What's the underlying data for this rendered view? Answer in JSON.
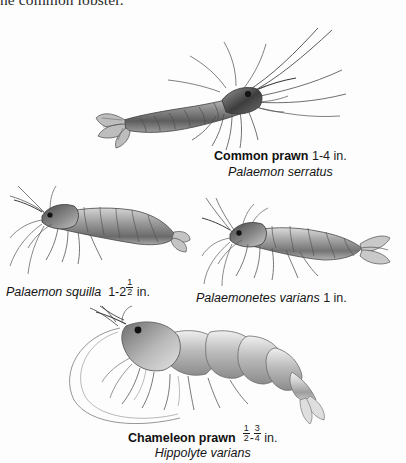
{
  "page": {
    "width": 406,
    "height": 463,
    "background": "#fdfdfd",
    "ink": "#1a1a1a",
    "running_text_clipped": "ne common lobster."
  },
  "figures": [
    {
      "id": "common-prawn",
      "common_name": "Common prawn",
      "size": "1-4 in.",
      "scientific_name": "Palaemon serratus",
      "orientation": "head-right",
      "caption_style": "bold-common-name"
    },
    {
      "id": "palaemon-squilla",
      "common_name": "",
      "size_prefix": "1-2",
      "size_fraction_num": "1",
      "size_fraction_den": "2",
      "size_suffix": "in.",
      "size_plain": "1-2 1/2 in.",
      "scientific_name": "Palaemon squilla",
      "orientation": "head-left",
      "caption_style": "italic-scientific-first"
    },
    {
      "id": "palaemonetes-varians",
      "common_name": "",
      "size": "1 in.",
      "scientific_name": "Palaemonetes varians",
      "orientation": "head-left",
      "caption_style": "italic-scientific-first"
    },
    {
      "id": "chameleon-prawn",
      "common_name": "Chameleon prawn",
      "size_fraction_a_num": "1",
      "size_fraction_a_den": "2",
      "size_fraction_b_num": "3",
      "size_fraction_b_den": "4",
      "size_suffix": "in.",
      "size_plain": "1/2-3/4 in.",
      "scientific_name": "Hippolyte varians",
      "orientation": "head-left",
      "caption_style": "bold-common-name"
    }
  ],
  "labels": {
    "dash": "-",
    "space": " "
  }
}
